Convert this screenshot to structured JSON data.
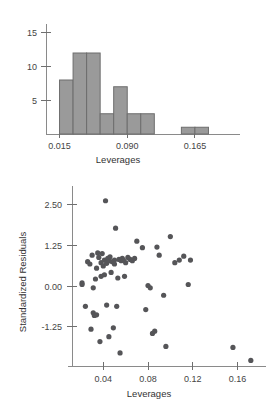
{
  "figure": {
    "background_color": "#ffffff",
    "bar_fill_color": "#9a9a9a",
    "bar_edge_color": "#6d6d6d",
    "point_color": "#555558",
    "axis_color": "#8a8a8a"
  },
  "chart_data": [
    {
      "type": "bar",
      "id": "leverages-histogram",
      "title": "",
      "xlabel": "Leverages",
      "ylabel": "",
      "grid": false,
      "legend": null,
      "xlim": [
        0.0,
        0.195
      ],
      "ylim": [
        0,
        16
      ],
      "xticks": [
        0.015,
        0.09,
        0.165
      ],
      "xtick_labels": [
        "0.015",
        "0.090",
        "0.165"
      ],
      "yticks": [
        5,
        10,
        15
      ],
      "ytick_labels": [
        "5",
        "10",
        "15"
      ],
      "bin_width": 0.015,
      "bin_edges": [
        0.015,
        0.03,
        0.045,
        0.06,
        0.075,
        0.09,
        0.105,
        0.12,
        0.135,
        0.15,
        0.165,
        0.18
      ],
      "categories": [
        "0.015-0.030",
        "0.030-0.045",
        "0.045-0.060",
        "0.060-0.075",
        "0.075-0.090",
        "0.090-0.105",
        "0.105-0.120",
        "0.120-0.135",
        "0.135-0.150",
        "0.150-0.165",
        "0.165-0.180"
      ],
      "values": [
        8,
        12,
        12,
        3,
        7,
        3,
        3,
        0,
        0,
        1,
        1
      ]
    },
    {
      "type": "scatter",
      "id": "residuals-vs-leverages",
      "title": "",
      "xlabel": "Leverages",
      "ylabel": "Standardized Residuals",
      "grid": false,
      "legend": null,
      "xlim": [
        0.012,
        0.182
      ],
      "ylim": [
        -2.45,
        2.95
      ],
      "xticks": [
        0.04,
        0.08,
        0.12,
        0.16
      ],
      "xtick_labels": [
        "0.04",
        "0.08",
        "0.12",
        "0.16"
      ],
      "yticks": [
        2.5,
        1.25,
        0.0,
        -1.25
      ],
      "ytick_labels": [
        "2.50",
        "1.25",
        "0.00",
        "-1.25"
      ],
      "x": [
        0.021,
        0.021,
        0.024,
        0.026,
        0.028,
        0.029,
        0.03,
        0.031,
        0.031,
        0.032,
        0.033,
        0.034,
        0.034,
        0.035,
        0.036,
        0.037,
        0.038,
        0.038,
        0.039,
        0.04,
        0.041,
        0.041,
        0.042,
        0.043,
        0.043,
        0.044,
        0.045,
        0.045,
        0.046,
        0.047,
        0.048,
        0.049,
        0.05,
        0.05,
        0.051,
        0.052,
        0.053,
        0.054,
        0.055,
        0.056,
        0.057,
        0.058,
        0.059,
        0.06,
        0.062,
        0.064,
        0.066,
        0.068,
        0.07,
        0.075,
        0.078,
        0.08,
        0.082,
        0.084,
        0.086,
        0.088,
        0.09,
        0.094,
        0.096,
        0.1,
        0.104,
        0.108,
        0.112,
        0.116,
        0.118,
        0.156,
        0.172
      ],
      "y": [
        0.1,
        0.05,
        -0.62,
        0.75,
        0.68,
        -1.32,
        0.95,
        -0.05,
        -0.82,
        -0.9,
        0.22,
        0.55,
        -0.88,
        1.02,
        0.88,
        -1.7,
        0.72,
        0.3,
        1.0,
        0.62,
        0.8,
        0.35,
        2.62,
        0.7,
        -0.58,
        0.85,
        0.78,
        -1.55,
        0.9,
        0.42,
        0.75,
        -1.28,
        0.8,
        0.68,
        1.78,
        -0.62,
        0.25,
        0.82,
        -2.05,
        0.78,
        0.85,
        0.8,
        0.3,
        0.72,
        0.88,
        0.82,
        0.78,
        0.85,
        1.38,
        1.18,
        -0.72,
        0.02,
        -0.05,
        -1.45,
        -1.38,
        1.2,
        0.95,
        -0.28,
        -1.85,
        1.52,
        0.72,
        0.8,
        0.92,
        0.05,
        0.8,
        -1.88,
        -2.28
      ]
    }
  ]
}
